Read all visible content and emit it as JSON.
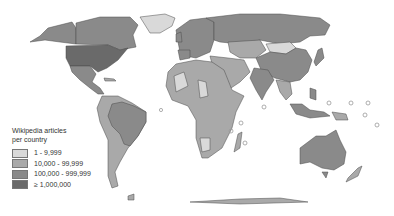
{
  "map": {
    "type": "choropleth-world",
    "projection": "world (Robinson-like)",
    "color_scale": [
      {
        "label": "1 - 9,999",
        "color": "#d9d9d9"
      },
      {
        "label": "10,000 - 99,999",
        "color": "#a9a9a9"
      },
      {
        "label": "100,000 - 999,999",
        "color": "#8a8a8a"
      },
      {
        "label": "≥ 1,000,000",
        "color": "#6a6a6a"
      }
    ]
  },
  "legend": {
    "title_line1": "Wikipedia articles",
    "title_line2": "per country",
    "items": [
      {
        "label": "1 - 9,999",
        "color": "#d9d9d9"
      },
      {
        "label": "10,000 - 99,999",
        "color": "#a9a9a9"
      },
      {
        "label": "100,000 - 999,999",
        "color": "#8a8a8a"
      },
      {
        "label": "≥ 1,000,000",
        "color": "#6a6a6a"
      }
    ]
  }
}
